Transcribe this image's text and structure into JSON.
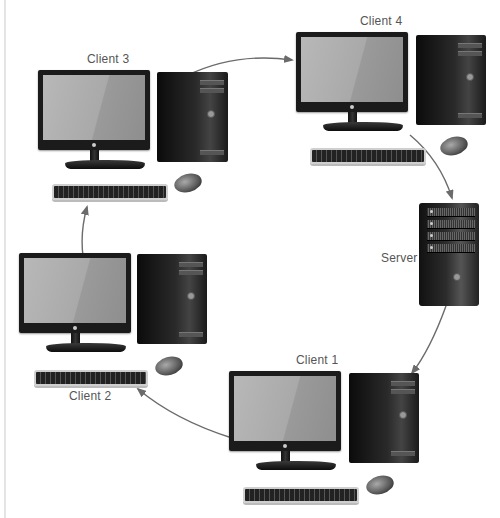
{
  "diagram": {
    "type": "ring-topology",
    "nodes": [
      {
        "id": "client3",
        "label": "Client 3",
        "kind": "workstation"
      },
      {
        "id": "client4",
        "label": "Client 4",
        "kind": "workstation"
      },
      {
        "id": "server",
        "label": "Server",
        "kind": "server"
      },
      {
        "id": "client1",
        "label": "Client 1",
        "kind": "workstation"
      },
      {
        "id": "client2",
        "label": "Client 2",
        "kind": "workstation"
      }
    ],
    "edges": [
      {
        "from": "client3",
        "to": "client4"
      },
      {
        "from": "client4",
        "to": "server"
      },
      {
        "from": "server",
        "to": "client1"
      },
      {
        "from": "client1",
        "to": "client2"
      },
      {
        "from": "client2",
        "to": "client3"
      }
    ],
    "colors": {
      "arrow": "#6b6b6b",
      "label": "#555555",
      "background": "#ffffff"
    }
  }
}
